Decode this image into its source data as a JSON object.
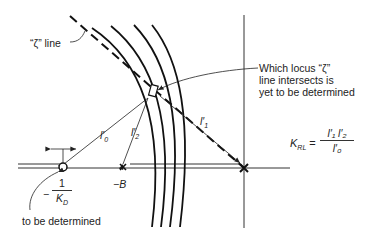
{
  "labels": {
    "zeta_line": "“ζ” line",
    "which_locus": [
      "Which locus “ζ”",
      "line intersects is",
      "yet to be determined"
    ],
    "to_be_determined": "to be determined",
    "minus_b": "−B",
    "kd_minus": "−",
    "kd_num": "1",
    "kd_den": "K",
    "kd_sub": "D",
    "l0": "l′",
    "l0_sub": "0",
    "l1": "l′",
    "l1_sub": "1",
    "l2": "l′",
    "l2_sub": "2",
    "krl": "K",
    "krl_sub": "RL",
    "krl_eq": "=",
    "krl_num": "l′₁ l′₂",
    "krl_den": "l′₀"
  }
}
